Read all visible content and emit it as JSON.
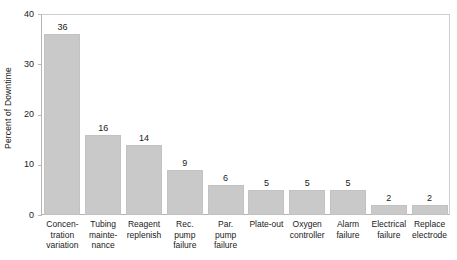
{
  "chart_data": {
    "type": "bar",
    "title": "",
    "xlabel": "",
    "ylabel": "Percent of Downtime",
    "ylim": [
      0,
      40
    ],
    "yticks": [
      0,
      10,
      20,
      30,
      40
    ],
    "grid": false,
    "legend": null,
    "bar_color": "#c9c9c9",
    "categories": [
      "Concentration variation",
      "Tubing maintenance",
      "Reagent replenish",
      "Rec. pump failure",
      "Par. pump failure",
      "Plate-out",
      "Oxygen controller",
      "Alarm failure",
      "Electrical failure",
      "Replace electrode"
    ],
    "category_lines": [
      [
        "Concen-",
        "tration",
        "variation"
      ],
      [
        "Tubing",
        "mainte-",
        "nance"
      ],
      [
        "Reagent",
        "replenish"
      ],
      [
        "Rec.",
        "pump",
        "failure"
      ],
      [
        "Par.",
        "pump",
        "failure"
      ],
      [
        "Plate-out"
      ],
      [
        "Oxygen",
        "controller"
      ],
      [
        "Alarm",
        "failure"
      ],
      [
        "Electrical",
        "failure"
      ],
      [
        "Replace",
        "electrode"
      ]
    ],
    "values": [
      36,
      16,
      14,
      9,
      6,
      5,
      5,
      5,
      2,
      2
    ],
    "value_labels": [
      "36",
      "16",
      "14",
      "9",
      "6",
      "5",
      "5",
      "5",
      "2",
      "2"
    ]
  },
  "axis": {
    "y_tick_labels": [
      "0",
      "10",
      "20",
      "30",
      "40"
    ]
  }
}
